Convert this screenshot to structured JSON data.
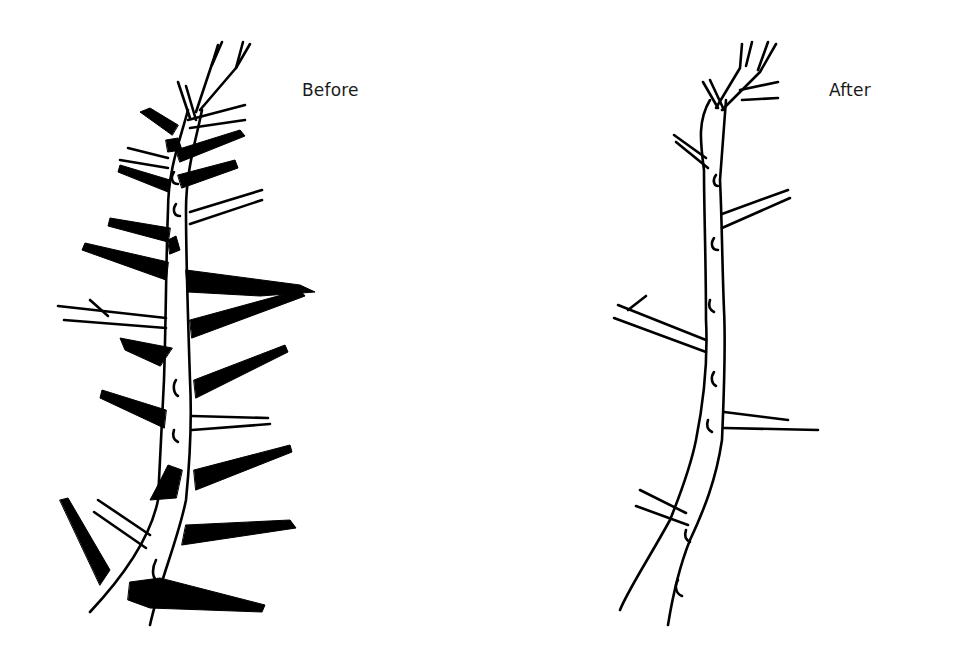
{
  "figure": {
    "panels": [
      {
        "id": "before",
        "label": "Before",
        "description": "Tree trunk with many branches; branches to be removed shaded black"
      },
      {
        "id": "after",
        "label": "After",
        "description": "Tree trunk after pruning with few remaining branches drawn in outline"
      }
    ]
  },
  "colors": {
    "ink": "#000000",
    "background": "#ffffff",
    "label_text": "#1a1a1a"
  }
}
